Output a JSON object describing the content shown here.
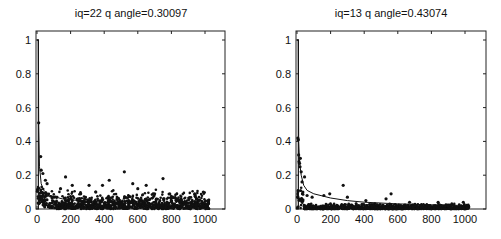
{
  "chart_data": [
    {
      "type": "scatter",
      "title": "iq=22 q angle=0.30097",
      "xlabel": "",
      "ylabel": "",
      "xlim": [
        0,
        1100
      ],
      "ylim": [
        0,
        1.05
      ],
      "xticks": [
        0,
        200,
        400,
        600,
        800,
        1000
      ],
      "yticks": [
        0,
        0.2,
        0.4,
        0.6,
        0.8,
        1
      ],
      "ytick_labels": [
        "0",
        "0.2",
        "0.4",
        "0.6",
        "0.8",
        "1"
      ],
      "grid": false,
      "legend": null,
      "note": "Points are illustrative; dense scatter mostly between 0 and 0.12, with outliers near 0.5 at x≈10, 0.31 at x≈20, 0.22 at x≈520, 0.18 at x≈760. A line series drops from 1 at x≈0-10 to ~0.1 and decays slowly.",
      "series": [
        {
          "name": "line",
          "kind": "line",
          "points": [
            [
              0,
              1.0
            ],
            [
              8,
              1.0
            ],
            [
              10,
              0.5
            ],
            [
              15,
              0.25
            ],
            [
              25,
              0.15
            ],
            [
              40,
              0.11
            ],
            [
              80,
              0.08
            ],
            [
              150,
              0.06
            ],
            [
              300,
              0.045
            ],
            [
              500,
              0.035
            ],
            [
              800,
              0.025
            ],
            [
              1024,
              0.02
            ]
          ]
        },
        {
          "name": "outliers",
          "kind": "scatter",
          "points": [
            [
              10,
              0.51
            ],
            [
              22,
              0.31
            ],
            [
              25,
              0.23
            ],
            [
              35,
              0.21
            ],
            [
              50,
              0.17
            ],
            [
              60,
              0.15
            ],
            [
              170,
              0.19
            ],
            [
              210,
              0.14
            ],
            [
              310,
              0.14
            ],
            [
              390,
              0.14
            ],
            [
              430,
              0.17
            ],
            [
              520,
              0.22
            ],
            [
              570,
              0.15
            ],
            [
              600,
              0.12
            ],
            [
              650,
              0.14
            ],
            [
              750,
              0.18
            ],
            [
              700,
              0.09
            ],
            [
              790,
              0.09
            ],
            [
              990,
              0.1
            ],
            [
              840,
              0.05
            ],
            [
              950,
              0.06
            ],
            [
              140,
              0.12
            ],
            [
              260,
              0.09
            ],
            [
              350,
              0.1
            ]
          ]
        }
      ]
    },
    {
      "type": "scatter",
      "title": "iq=13 q angle=0.43074",
      "xlabel": "",
      "ylabel": "",
      "xlim": [
        0,
        1100
      ],
      "ylim": [
        0,
        1.05
      ],
      "xticks": [
        0,
        200,
        400,
        600,
        800,
        1000
      ],
      "yticks": [
        0,
        0.2,
        0.4,
        0.6,
        0.8,
        1
      ],
      "ytick_labels": [
        "0",
        "0.2",
        "0.4",
        "0.6",
        "0.8",
        "1"
      ],
      "grid": false,
      "legend": null,
      "note": "Points are illustrative; dense band near 0-0.03, cluster 0.25-0.4 at x<30, outliers at 0.14 (x≈275), 0.09 (x≈560). A fitted line decays from 1 at x≈0-10 to ~0.08 at x=100 and ~0.02 at 1000.",
      "series": [
        {
          "name": "line",
          "kind": "line",
          "points": [
            [
              0,
              1.0
            ],
            [
              8,
              1.0
            ],
            [
              10,
              0.4
            ],
            [
              15,
              0.28
            ],
            [
              25,
              0.2
            ],
            [
              40,
              0.14
            ],
            [
              60,
              0.11
            ],
            [
              100,
              0.09
            ],
            [
              200,
              0.065
            ],
            [
              300,
              0.05
            ],
            [
              400,
              0.04
            ],
            [
              600,
              0.03
            ],
            [
              800,
              0.025
            ],
            [
              1024,
              0.02
            ]
          ]
        },
        {
          "name": "outliers",
          "kind": "scatter",
          "points": [
            [
              5,
              0.42
            ],
            [
              8,
              0.41
            ],
            [
              10,
              0.32
            ],
            [
              12,
              0.28
            ],
            [
              15,
              0.27
            ],
            [
              18,
              0.25
            ],
            [
              20,
              0.3
            ],
            [
              25,
              0.22
            ],
            [
              30,
              0.16
            ],
            [
              45,
              0.19
            ],
            [
              35,
              0.1
            ],
            [
              60,
              0.08
            ],
            [
              90,
              0.07
            ],
            [
              160,
              0.08
            ],
            [
              195,
              0.09
            ],
            [
              275,
              0.14
            ],
            [
              300,
              0.07
            ],
            [
              410,
              0.05
            ],
            [
              530,
              0.06
            ],
            [
              560,
              0.09
            ],
            [
              670,
              0.04
            ],
            [
              840,
              0.04
            ],
            [
              990,
              0.04
            ]
          ]
        }
      ]
    }
  ]
}
